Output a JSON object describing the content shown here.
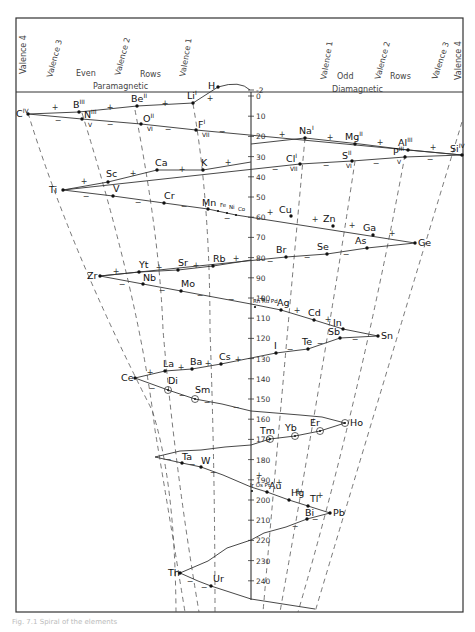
{
  "header": {
    "left": {
      "valence_labels": [
        "Valence 4",
        "Valence 3",
        "Valence 2",
        "Valence 1"
      ],
      "row_type": [
        "Even",
        "Rows"
      ],
      "magnetism": "Paramagnetic"
    },
    "right": {
      "valence_labels": [
        "Valence 1",
        "Valence 2",
        "Valence 3",
        "Valence 4"
      ],
      "row_type": [
        "Odd",
        "Rows"
      ],
      "magnetism": "Diamagnetic"
    }
  },
  "axis": {
    "ticks": [
      "-2",
      "0",
      "10",
      "20",
      "30",
      "40",
      "50",
      "60",
      "70",
      "80",
      "90",
      "100",
      "110",
      "120",
      "130",
      "140",
      "150",
      "160",
      "170",
      "180",
      "190",
      "200",
      "210",
      "220",
      "230",
      "240"
    ]
  },
  "elements": [
    {
      "symbol": "H",
      "sup": "",
      "sub": ""
    },
    {
      "symbol": "Li",
      "sup": "I",
      "sub": ""
    },
    {
      "symbol": "Be",
      "sup": "II",
      "sub": ""
    },
    {
      "symbol": "B",
      "sup": "III",
      "sub": ""
    },
    {
      "symbol": "C",
      "sup": "IV",
      "sub": ""
    },
    {
      "symbol": "N",
      "sup": "III",
      "sub": "V"
    },
    {
      "symbol": "O",
      "sup": "II",
      "sub": "VI"
    },
    {
      "symbol": "F",
      "sup": "I",
      "sub": "VII"
    },
    {
      "symbol": "Na",
      "sup": "I",
      "sub": ""
    },
    {
      "symbol": "Mg",
      "sup": "II",
      "sub": ""
    },
    {
      "symbol": "Al",
      "sup": "III",
      "sub": ""
    },
    {
      "symbol": "Si",
      "sup": "IV",
      "sub": ""
    },
    {
      "symbol": "P",
      "sup": "III",
      "sub": "V"
    },
    {
      "symbol": "S",
      "sup": "II",
      "sub": "VI"
    },
    {
      "symbol": "Cl",
      "sup": "I",
      "sub": "VII"
    },
    {
      "symbol": "K",
      "sup": "",
      "sub": ""
    },
    {
      "symbol": "Ca",
      "sup": "",
      "sub": ""
    },
    {
      "symbol": "Sc",
      "sup": "",
      "sub": ""
    },
    {
      "symbol": "Ti",
      "sup": "",
      "sub": ""
    },
    {
      "symbol": "V",
      "sup": "",
      "sub": ""
    },
    {
      "symbol": "Cr",
      "sup": "",
      "sub": ""
    },
    {
      "symbol": "Mn",
      "sup": "",
      "sub": ""
    },
    {
      "symbol": "Fe",
      "sup": "",
      "sub": ""
    },
    {
      "symbol": "Ni",
      "sup": "",
      "sub": ""
    },
    {
      "symbol": "Co",
      "sup": "",
      "sub": ""
    },
    {
      "symbol": "Cu",
      "sup": "",
      "sub": ""
    },
    {
      "symbol": "Zn",
      "sup": "",
      "sub": ""
    },
    {
      "symbol": "Ga",
      "sup": "",
      "sub": ""
    },
    {
      "symbol": "Ge",
      "sup": "",
      "sub": ""
    },
    {
      "symbol": "As",
      "sup": "",
      "sub": ""
    },
    {
      "symbol": "Se",
      "sup": "",
      "sub": ""
    },
    {
      "symbol": "Br",
      "sup": "",
      "sub": ""
    },
    {
      "symbol": "Rb",
      "sup": "",
      "sub": ""
    },
    {
      "symbol": "Sr",
      "sup": "",
      "sub": ""
    },
    {
      "symbol": "Yt",
      "sup": "",
      "sub": ""
    },
    {
      "symbol": "Zr",
      "sup": "",
      "sub": ""
    },
    {
      "symbol": "Nb",
      "sup": "",
      "sub": ""
    },
    {
      "symbol": "Mo",
      "sup": "",
      "sub": ""
    },
    {
      "symbol": "Rh Ru Pd",
      "sup": "",
      "sub": ""
    },
    {
      "symbol": "Ag",
      "sup": "",
      "sub": ""
    },
    {
      "symbol": "Cd",
      "sup": "",
      "sub": ""
    },
    {
      "symbol": "In",
      "sup": "",
      "sub": ""
    },
    {
      "symbol": "Sn",
      "sup": "",
      "sub": ""
    },
    {
      "symbol": "Sb",
      "sup": "",
      "sub": ""
    },
    {
      "symbol": "Te",
      "sup": "",
      "sub": ""
    },
    {
      "symbol": "I",
      "sup": "",
      "sub": ""
    },
    {
      "symbol": "Cs",
      "sup": "",
      "sub": ""
    },
    {
      "symbol": "Ba",
      "sup": "",
      "sub": ""
    },
    {
      "symbol": "La",
      "sup": "",
      "sub": ""
    },
    {
      "symbol": "Ce",
      "sup": "",
      "sub": ""
    },
    {
      "symbol": "Di",
      "sup": "",
      "sub": ""
    },
    {
      "symbol": "Sm",
      "sup": "",
      "sub": ""
    },
    {
      "symbol": "Ho",
      "sup": "",
      "sub": ""
    },
    {
      "symbol": "Er",
      "sup": "",
      "sub": ""
    },
    {
      "symbol": "Yb",
      "sup": "",
      "sub": ""
    },
    {
      "symbol": "Tm",
      "sup": "",
      "sub": ""
    },
    {
      "symbol": "Ta",
      "sup": "",
      "sub": ""
    },
    {
      "symbol": "W",
      "sup": "",
      "sub": ""
    },
    {
      "symbol": "Ir Os Pt",
      "sup": "",
      "sub": ""
    },
    {
      "symbol": "Au",
      "sup": "",
      "sub": ""
    },
    {
      "symbol": "Hg",
      "sup": "",
      "sub": ""
    },
    {
      "symbol": "Tl",
      "sup": "",
      "sub": ""
    },
    {
      "symbol": "Pb",
      "sup": "",
      "sub": ""
    },
    {
      "symbol": "Bi",
      "sup": "",
      "sub": ""
    },
    {
      "symbol": "Th",
      "sup": "",
      "sub": ""
    },
    {
      "symbol": "Ur",
      "sup": "",
      "sub": ""
    }
  ],
  "signs": {
    "plus": "+",
    "minus": "−"
  },
  "caption": "Fig. 7.1 Spiral of the elements"
}
